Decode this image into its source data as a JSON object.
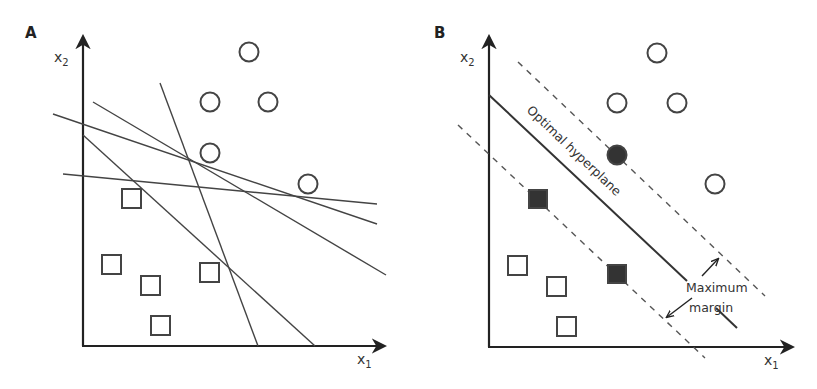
{
  "figure": {
    "panels": [
      {
        "id": "A",
        "label": "A",
        "x_axis_label": "x",
        "x_axis_sub": "1",
        "y_axis_label": "x",
        "y_axis_sub": "2",
        "circles": [
          {
            "x": 249,
            "y": 52,
            "filled": false
          },
          {
            "x": 210,
            "y": 102,
            "filled": false
          },
          {
            "x": 268,
            "y": 102,
            "filled": false
          },
          {
            "x": 210,
            "y": 153,
            "filled": false
          },
          {
            "x": 308,
            "y": 184,
            "filled": false
          }
        ],
        "squares": [
          {
            "x": 132,
            "y": 199,
            "filled": false
          },
          {
            "x": 112,
            "y": 265,
            "filled": false
          },
          {
            "x": 151,
            "y": 285,
            "filled": false
          },
          {
            "x": 210,
            "y": 273,
            "filled": false
          },
          {
            "x": 161,
            "y": 325,
            "filled": false
          }
        ],
        "candidate_lines": [
          {
            "x1": 93,
            "y1": 102,
            "x2": 386,
            "y2": 275
          },
          {
            "x1": 53,
            "y1": 114,
            "x2": 377,
            "y2": 224
          },
          {
            "x1": 160,
            "y1": 83,
            "x2": 258,
            "y2": 346
          },
          {
            "x1": 83,
            "y1": 135,
            "x2": 315,
            "y2": 346
          },
          {
            "x1": 63,
            "y1": 174,
            "x2": 377,
            "y2": 204
          }
        ]
      },
      {
        "id": "B",
        "label": "B",
        "x_axis_label": "x",
        "x_axis_sub": "1",
        "y_axis_label": "x",
        "y_axis_sub": "2",
        "circles": [
          {
            "x": 657,
            "y": 53,
            "filled": false
          },
          {
            "x": 617,
            "y": 103,
            "filled": false
          },
          {
            "x": 677,
            "y": 103,
            "filled": false
          },
          {
            "x": 617,
            "y": 155,
            "filled": true
          },
          {
            "x": 715,
            "y": 184,
            "filled": false
          }
        ],
        "squares": [
          {
            "x": 538,
            "y": 199,
            "filled": true
          },
          {
            "x": 617,
            "y": 274,
            "filled": true
          },
          {
            "x": 518,
            "y": 266,
            "filled": false
          },
          {
            "x": 557,
            "y": 287,
            "filled": false
          },
          {
            "x": 567,
            "y": 327,
            "filled": false
          }
        ],
        "hyperplane_label": "Optimal hyperplane",
        "margin_label_line1": "Maximum",
        "margin_label_line2": "margin"
      }
    ]
  }
}
